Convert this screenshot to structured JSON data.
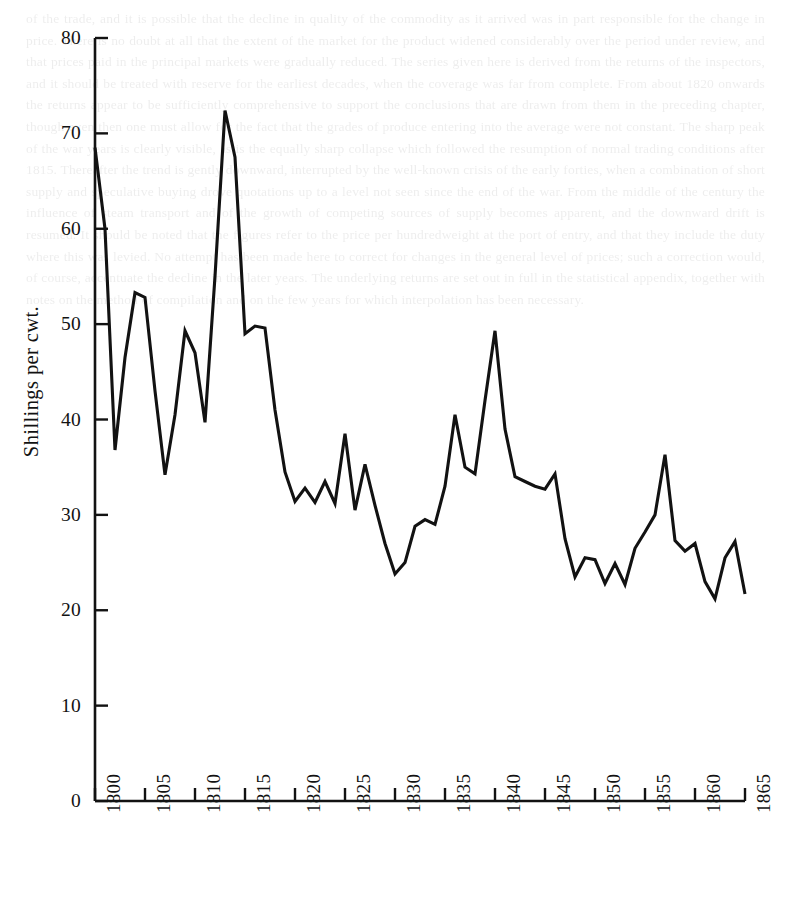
{
  "figure": {
    "kind": "line-chart",
    "background_color": "#ffffff",
    "ink_color": "#121212"
  },
  "axes": {
    "y_title": "Shillings per cwt.",
    "y_ticks": [
      0,
      10,
      20,
      30,
      40,
      50,
      60,
      70,
      80
    ],
    "x_ticks": [
      1800,
      1805,
      1810,
      1815,
      1820,
      1825,
      1830,
      1835,
      1840,
      1845,
      1850,
      1855,
      1860,
      1865
    ]
  },
  "page_bleed_text": "of the trade, and it is possible that the decline in quality of the commodity as it arrived was in part responsible for the change in price. There is no doubt at all that the extent of the market for the product widened considerably over the period under review, and that prices paid in the principal markets were gradually reduced. The series given here is derived from the returns of the inspectors, and it should be treated with reserve for the earliest decades, when the coverage was far from complete. From about 1820 onwards the returns appear to be sufficiently comprehensive to support the conclusions that are drawn from them in the preceding chapter, though even then one must allow for the fact that the grades of produce entering into the average were not constant. The sharp peak of the war years is clearly visible, as is the equally sharp collapse which followed the resumption of normal trading conditions after 1815. Thereafter the trend is gently downward, interrupted by the well-known crisis of the early forties, when a combination of short supply and speculative buying drove quotations up to a level not seen since the end of the war. From the middle of the century the influence of steam transport and of the growth of competing sources of supply becomes apparent, and the downward drift is resumed. It should be noted that the figures refer to the price per hundredweight at the port of entry, and that they include the duty where this was levied. No attempt has been made here to correct for changes in the general level of prices; such a correction would, of course, accentuate the decline in the later years. The underlying returns are set out in full in the statistical appendix, together with notes on the method of compilation and on the few years for which interpolation has been necessary.",
  "chart_data": {
    "type": "line",
    "title": "",
    "xlabel": "",
    "ylabel": "Shillings per cwt.",
    "xlim": [
      1800,
      1865
    ],
    "ylim": [
      0,
      80
    ],
    "grid": false,
    "legend": "none",
    "series": [
      {
        "name": "Price",
        "x": [
          1800,
          1801,
          1802,
          1803,
          1804,
          1805,
          1806,
          1807,
          1808,
          1809,
          1810,
          1811,
          1812,
          1813,
          1814,
          1815,
          1816,
          1817,
          1818,
          1819,
          1820,
          1821,
          1822,
          1823,
          1824,
          1825,
          1826,
          1827,
          1828,
          1829,
          1830,
          1831,
          1832,
          1833,
          1834,
          1835,
          1836,
          1837,
          1838,
          1839,
          1840,
          1841,
          1842,
          1843,
          1844,
          1845,
          1846,
          1847,
          1848,
          1849,
          1850,
          1851,
          1852,
          1853,
          1854,
          1855,
          1856,
          1857,
          1858,
          1859,
          1860,
          1861,
          1862,
          1863,
          1864,
          1865
        ],
        "values": [
          68.5,
          60.0,
          36.8,
          46.5,
          53.3,
          52.8,
          43.0,
          34.2,
          40.5,
          49.3,
          47.0,
          39.7,
          55.0,
          72.4,
          67.5,
          49.0,
          49.8,
          49.6,
          41.0,
          34.5,
          31.4,
          32.8,
          31.3,
          33.5,
          31.2,
          38.5,
          30.5,
          35.3,
          31.0,
          27.0,
          23.8,
          25.0,
          28.8,
          29.5,
          29.0,
          33.0,
          40.5,
          35.0,
          34.3,
          42.0,
          49.3,
          39.0,
          34.0,
          33.5,
          33.0,
          32.7,
          34.3,
          27.5,
          23.5,
          25.5,
          25.3,
          22.8,
          24.9,
          22.7,
          26.5,
          28.2,
          30.0,
          36.3,
          27.3,
          26.2,
          27.0,
          23.0,
          21.2,
          25.5,
          27.2,
          21.7
        ]
      }
    ]
  }
}
